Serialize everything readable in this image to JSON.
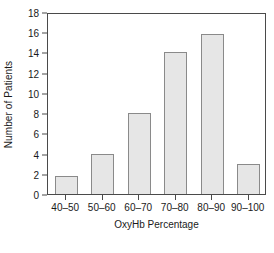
{
  "chart_data": {
    "type": "bar",
    "title": "",
    "xlabel": "OxyHb Percentage",
    "ylabel": "Number of Patients",
    "categories": [
      "40–50",
      "50–60",
      "60–70",
      "70–80",
      "80–90",
      "90–100"
    ],
    "values": [
      1.8,
      4,
      8,
      14,
      15.8,
      3
    ],
    "ylim": [
      0,
      18
    ],
    "ytick_labels": [
      "0",
      "2",
      "4",
      "6",
      "8",
      "10",
      "12",
      "14",
      "16",
      "18"
    ],
    "ytick_values": [
      0,
      2,
      4,
      6,
      8,
      10,
      12,
      14,
      16,
      18
    ],
    "grid": false,
    "legend": false,
    "bar_fill_color": "#e6e6e6",
    "bar_border_color": "#8a8a8a",
    "axis_color": "#4a4a4a",
    "background_color": "#ffffff"
  }
}
